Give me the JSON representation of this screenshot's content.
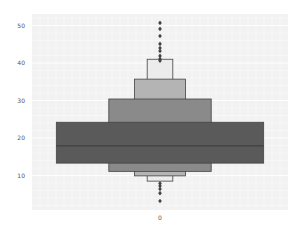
{
  "chart_data": {
    "type": "boxen",
    "title": "",
    "xlabel": "",
    "ylabel": "",
    "categories": [
      "0"
    ],
    "ylim": [
      0,
      52
    ],
    "yticks": [
      10,
      20,
      30,
      40,
      50
    ],
    "grid": true,
    "legend": null,
    "median": 17.9,
    "boxes": [
      {
        "level": 1,
        "low": 13.3,
        "high": 24.2,
        "width_frac": 0.81,
        "color": "#5a5a5a"
      },
      {
        "level": 2,
        "low": 11.1,
        "high": 30.4,
        "width_frac": 0.4,
        "color": "#8a8a8a"
      },
      {
        "level": 3,
        "low": 9.9,
        "high": 35.7,
        "width_frac": 0.2,
        "color": "#b4b4b4"
      },
      {
        "level": 4,
        "low": 8.5,
        "high": 41.0,
        "width_frac": 0.1,
        "color": "#ececec"
      }
    ],
    "outliers": [
      50.7,
      49.1,
      47.2,
      45.1,
      44.0,
      43.2,
      41.9,
      41.1,
      40.6,
      7.9,
      7.2,
      6.4,
      5.3,
      3.2
    ]
  },
  "axis": {
    "y_tick_labels": [
      "10",
      "20",
      "30",
      "40",
      "50"
    ],
    "x_tick_labels": [
      "0"
    ]
  },
  "colors": {
    "plot_background": "#f2f2f2",
    "grid": "#ffffff",
    "median_line": "#3a3a3a",
    "outlier": "#444444",
    "edge": "#444444"
  }
}
